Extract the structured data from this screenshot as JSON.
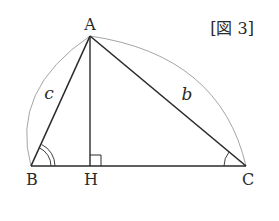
{
  "figure": {
    "caption": "[図 3]",
    "caption_parts": {
      "open": "[",
      "text": "図 3",
      "close": "]"
    }
  },
  "points": {
    "A": {
      "label": "A",
      "x": 90,
      "y": 36
    },
    "B": {
      "label": "B",
      "x": 31,
      "y": 166
    },
    "H": {
      "label": "H",
      "x": 90,
      "y": 166
    },
    "C": {
      "label": "C",
      "x": 246,
      "y": 166
    }
  },
  "sides": {
    "c": {
      "label": "c",
      "from": "A",
      "to": "B"
    },
    "b": {
      "label": "b",
      "from": "A",
      "to": "C"
    }
  },
  "segments": [
    "AB",
    "AC",
    "BC",
    "AH"
  ],
  "marks": {
    "angle_B": "double arc",
    "angle_C": "single arc",
    "angle_AHC": "right angle"
  },
  "colors": {
    "line": "#2a2a2a",
    "arc": "#999999",
    "text": "#2a2a2a"
  }
}
